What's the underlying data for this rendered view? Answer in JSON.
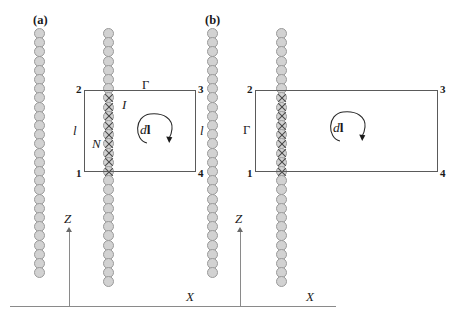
{
  "figure": {
    "type": "physics-diagram"
  },
  "panels": [
    {
      "id": "a",
      "label": "(a)",
      "columns": [
        {
          "name": "left-bead-column",
          "marked": false,
          "bead_count": 27
        },
        {
          "name": "right-bead-column",
          "marked": true,
          "bead_count": 28
        }
      ],
      "loop": {
        "name": "amperian-loop",
        "shape": "square",
        "corners": {
          "top_left": "2",
          "top_right": "3",
          "bottom_left": "1",
          "bottom_right": "4"
        },
        "contour_label": "Γ",
        "contour_label_position": "top-edge",
        "side_labels": {
          "left": "l",
          "right": "l"
        },
        "current_label": "I",
        "turns_label": "N",
        "element_label": "dl",
        "element_symbol_d": "d",
        "element_symbol_l": "l"
      },
      "axes": {
        "vertical": "Z",
        "horizontal": "X"
      }
    },
    {
      "id": "b",
      "label": "(b)",
      "columns": [
        {
          "name": "left-bead-column",
          "marked": false,
          "bead_count": 27
        },
        {
          "name": "right-bead-column",
          "marked": true,
          "bead_count": 28
        }
      ],
      "loop": {
        "name": "amperian-loop",
        "shape": "rectangle",
        "corners": {
          "top_left": "2",
          "top_right": "3",
          "bottom_left": "1",
          "bottom_right": "4"
        },
        "contour_label": "Γ",
        "contour_label_position": "left-edge",
        "element_label": "dl",
        "element_symbol_d": "d",
        "element_symbol_l": "l"
      },
      "axes": {
        "vertical": "Z",
        "horizontal": "X"
      }
    }
  ],
  "colors": {
    "bead_fill": "#d2d2d2",
    "bead_stroke": "#9a9a9a",
    "cross_stroke": "#4a4a4a",
    "loop_stroke": "#5a5a5a",
    "axis_stroke": "#8a8a8a",
    "text": "#1a1a1a",
    "background": "#ffffff"
  }
}
